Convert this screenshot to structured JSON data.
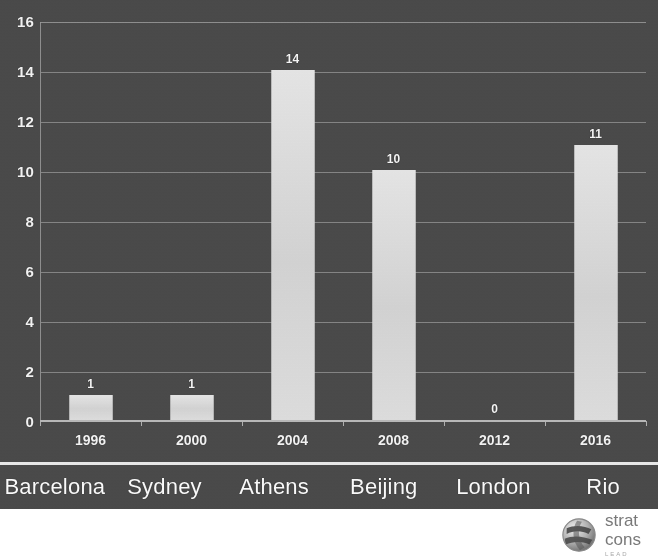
{
  "chart_data": {
    "type": "bar",
    "title": "",
    "subtitle": "",
    "xlabel": "",
    "ylabel": "",
    "categories": [
      "1996",
      "2000",
      "2004",
      "2008",
      "2012",
      "2016"
    ],
    "secondary_categories": [
      "Barcelona",
      "Sydney",
      "Athens",
      "Beijing",
      "London",
      "Rio"
    ],
    "values": [
      1,
      1,
      14,
      10,
      0,
      11
    ],
    "data_labels": [
      "1",
      "1",
      "14",
      "10",
      "0",
      "11"
    ],
    "ylim": [
      0,
      16
    ],
    "ytick_values": [
      0,
      2,
      4,
      6,
      8,
      10,
      12,
      14,
      16
    ],
    "ytick_labels": [
      "0",
      "2",
      "4",
      "6",
      "8",
      "10",
      "12",
      "14",
      "16"
    ],
    "grid": true,
    "legend": false,
    "legend_position": "none",
    "bar_color": "#dcdcdc",
    "plot_background": "#4a4a4a",
    "gridline_color": "#8f8f8f",
    "text_color": "#f2f2f2"
  },
  "chart": {
    "panel_background": "#4a4a4a"
  },
  "footer": {
    "logo": {
      "mark_name": "globe-swirl-logo",
      "line1": "strat",
      "line2": "cons",
      "line3": "LEAD",
      "color": "#7a7a7a"
    }
  }
}
